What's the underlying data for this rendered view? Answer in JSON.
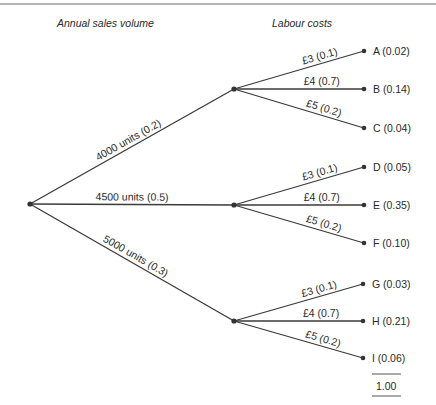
{
  "headers": {
    "sales": "Annual sales volume",
    "labour": "Labour costs"
  },
  "root": {
    "x": 30,
    "y": 204
  },
  "sales_branches": [
    {
      "label": "4000 units (0.2)",
      "node": {
        "x": 234,
        "y": 89
      }
    },
    {
      "label": "4500 units (0.5)",
      "node": {
        "x": 234,
        "y": 205
      }
    },
    {
      "label": "5000 units (0.3)",
      "node": {
        "x": 234,
        "y": 321
      }
    }
  ],
  "labour_branches": [
    {
      "parent": 0,
      "label": "£3 (0.1)",
      "leaf": {
        "x": 364,
        "y": 51
      },
      "outcome": "A (0.02)"
    },
    {
      "parent": 0,
      "label": "£4 (0.7)",
      "leaf": {
        "x": 364,
        "y": 89
      },
      "outcome": "B (0.14)"
    },
    {
      "parent": 0,
      "label": "£5 (0.2)",
      "leaf": {
        "x": 364,
        "y": 128
      },
      "outcome": "C (0.04)"
    },
    {
      "parent": 1,
      "label": "£3 (0.1)",
      "leaf": {
        "x": 364,
        "y": 167
      },
      "outcome": "D (0.05)"
    },
    {
      "parent": 1,
      "label": "£4 (0.7)",
      "leaf": {
        "x": 364,
        "y": 205
      },
      "outcome": "E (0.35)"
    },
    {
      "parent": 1,
      "label": "£5 (0.2)",
      "leaf": {
        "x": 364,
        "y": 243
      },
      "outcome": "F (0.10)"
    },
    {
      "parent": 2,
      "label": "£3 (0.1)",
      "leaf": {
        "x": 363,
        "y": 284
      },
      "outcome": "G (0.03)"
    },
    {
      "parent": 2,
      "label": "£4 (0.7)",
      "leaf": {
        "x": 363,
        "y": 321
      },
      "outcome": "H (0.21)"
    },
    {
      "parent": 2,
      "label": "£5 (0.2)",
      "leaf": {
        "x": 363,
        "y": 358
      },
      "outcome": "I (0.06)"
    }
  ],
  "total": "1.00"
}
